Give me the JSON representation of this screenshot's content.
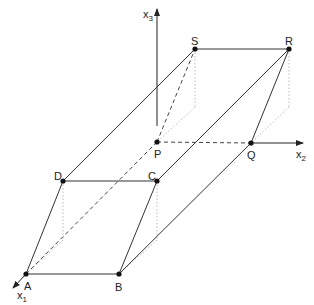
{
  "diagram": {
    "axes": {
      "x1": {
        "label": "x",
        "sub": "1"
      },
      "x2": {
        "label": "x",
        "sub": "2"
      },
      "x3": {
        "label": "x",
        "sub": "3"
      }
    },
    "points": {
      "A": {
        "label": "A"
      },
      "B": {
        "label": "B"
      },
      "C": {
        "label": "C"
      },
      "D": {
        "label": "D"
      },
      "P": {
        "label": "P"
      },
      "Q": {
        "label": "Q"
      },
      "R": {
        "label": "R"
      },
      "S": {
        "label": "S"
      }
    },
    "colors": {
      "line": "#333333",
      "dotted": "#bbbbbb",
      "point": "#111111"
    }
  }
}
